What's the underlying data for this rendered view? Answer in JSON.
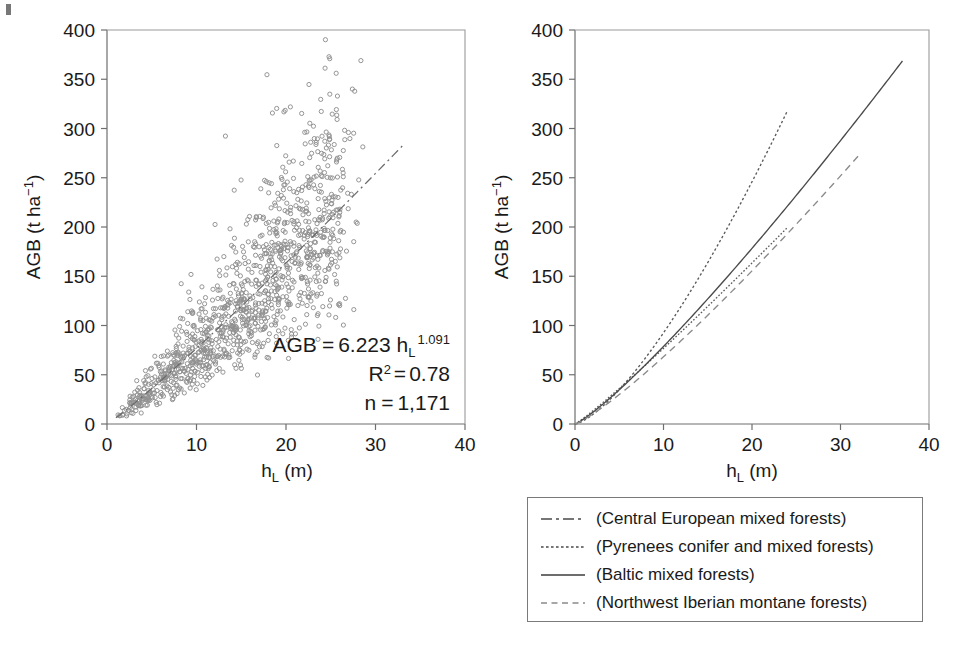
{
  "figure": {
    "background": "#ffffff",
    "point_color": "#8f8f8f",
    "line_color": "#5a5a5a",
    "axis_color": "#6f6f6f"
  },
  "panels": [
    {
      "id": "left",
      "name": "scatter-panel",
      "xlabel_main": "h",
      "xlabel_sub": "L",
      "xlabel_unit": " (m)",
      "ylabel_main": "AGB (t ha",
      "ylabel_sup": "−1",
      "ylabel_tail": ")",
      "xticks": [
        "0",
        "10",
        "20",
        "30",
        "40"
      ],
      "xtick_values": [
        0,
        10,
        20,
        30,
        40
      ],
      "yticks": [
        "0",
        "50",
        "100",
        "150",
        "200",
        "250",
        "300",
        "350",
        "400"
      ],
      "ytick_values": [
        0,
        50,
        100,
        150,
        200,
        250,
        300,
        350,
        400
      ],
      "xlim": [
        0,
        40
      ],
      "ylim": [
        0,
        400
      ],
      "annotations": {
        "equation_lhs": "AGB",
        "equation_eq": "=",
        "equation_coef": "6.223 h",
        "equation_sub": "L",
        "equation_exp": "1.091",
        "r2_label": "R",
        "r2_sup": "2",
        "r2_eq": "=",
        "r2_value": "0.78",
        "n_label": "n",
        "n_eq": "=",
        "n_value": "1,171"
      },
      "fit": {
        "coefficient": 6.223,
        "exponent": 1.091,
        "r_squared": 0.78,
        "n": 1171,
        "style": "dashdot",
        "x_start": 1,
        "x_end": 33
      }
    },
    {
      "id": "right",
      "name": "curves-panel",
      "xlabel_main": "h",
      "xlabel_sub": "L",
      "xlabel_unit": " (m)",
      "ylabel_main": "AGB (t ha",
      "ylabel_sup": "−1",
      "ylabel_tail": ")",
      "xticks": [
        "0",
        "10",
        "20",
        "30",
        "40"
      ],
      "xtick_values": [
        0,
        10,
        20,
        30,
        40
      ],
      "yticks": [
        "0",
        "50",
        "100",
        "150",
        "200",
        "250",
        "300",
        "350",
        "400"
      ],
      "ytick_values": [
        0,
        50,
        100,
        150,
        200,
        250,
        300,
        350,
        400
      ],
      "xlim": [
        0,
        40
      ],
      "ylim": [
        0,
        400
      ]
    }
  ],
  "chart_data": [
    {
      "type": "scatter",
      "title": "",
      "xlabel": "h_L (m)",
      "ylabel": "AGB (t ha^-1)",
      "xlim": [
        0,
        40
      ],
      "ylim": [
        0,
        400
      ],
      "grid": false,
      "legend": "none",
      "marker": "open-circle",
      "marker_color": "#8f8f8f",
      "n_points": 1171,
      "annotation_text": "AGB = 6.223 h_L^1.091; R^2 = 0.78; n = 1,171",
      "fit_curve": {
        "name": "Central European mixed forests fit",
        "form": "AGB = a * h_L^b",
        "a": 6.223,
        "b": 1.091,
        "style": "dashdot",
        "x_range": [
          1,
          33
        ]
      },
      "points_note": "1,171 plot-level observations; cloud rises from near (0,0) to roughly (33,280) with scatter up to 375 t/ha",
      "point_cloud_envelope": {
        "x": [
          0,
          5,
          10,
          15,
          20,
          25,
          30,
          33
        ],
        "y_mean": [
          0,
          35,
          73,
          115,
          158,
          205,
          250,
          280
        ],
        "y_low": [
          0,
          8,
          28,
          50,
          70,
          95,
          135,
          150
        ],
        "y_high": [
          10,
          75,
          135,
          200,
          250,
          310,
          375,
          310
        ]
      }
    },
    {
      "type": "line",
      "title": "",
      "xlabel": "h_L (m)",
      "ylabel": "AGB (t ha^-1)",
      "xlim": [
        0,
        40
      ],
      "ylim": [
        0,
        400
      ],
      "grid": false,
      "legend": "below-panel",
      "x": [
        0,
        2,
        4,
        6,
        8,
        10,
        12,
        14,
        16,
        18,
        20,
        22,
        24,
        26,
        28,
        30,
        32,
        34,
        36,
        37
      ],
      "series": [
        {
          "name": "(Central European mixed forests)",
          "style": "dashdot",
          "color": "#5a5a5a",
          "a": 6.223,
          "b": 1.091,
          "x_max": 24,
          "values": [
            0,
            13,
            28,
            43,
            59,
            76,
            93,
            110,
            127,
            145,
            163,
            181,
            199
          ]
        },
        {
          "name": "(Pyrenees conifer and mixed forests)",
          "style": "dotted",
          "color": "#5a5a5a",
          "a": 3.6,
          "b": 1.41,
          "x_max": 24,
          "values": [
            0,
            10,
            25,
            45,
            66,
            91,
            117,
            145,
            175,
            206,
            238,
            272,
            320
          ]
        },
        {
          "name": "(Baltic mixed forests)",
          "style": "solid",
          "color": "#4a4a4a",
          "a": 5.2,
          "b": 1.18,
          "x_max": 37,
          "values": [
            0,
            12,
            27,
            43,
            60,
            78,
            97,
            116,
            136,
            156,
            176,
            197,
            218,
            239,
            261,
            283,
            305,
            327,
            350,
            358
          ]
        },
        {
          "name": "(Northwest Iberian montane forests)",
          "style": "dashed",
          "color": "#8a8a8a",
          "a": 4.4,
          "b": 1.19,
          "x_max": 32,
          "values": [
            0,
            9,
            21,
            35,
            49,
            65,
            81,
            97,
            114,
            131,
            149,
            166,
            184,
            202,
            221,
            239,
            270
          ]
        }
      ]
    }
  ],
  "legend": {
    "name": "curve-legend",
    "items": [
      {
        "style": "dashdot",
        "label": "(Central European mixed forests)"
      },
      {
        "style": "dotted",
        "label": "(Pyrenees conifer and mixed forests)"
      },
      {
        "style": "solid",
        "label": "(Baltic mixed forests)"
      },
      {
        "style": "dashed",
        "label": "(Northwest Iberian montane forests)"
      }
    ]
  }
}
